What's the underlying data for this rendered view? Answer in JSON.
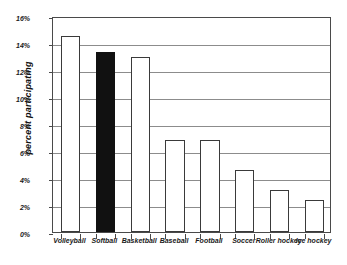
{
  "chart_data": {
    "type": "bar",
    "title": "",
    "xlabel": "",
    "ylabel": "percent participating",
    "categories": [
      "Volleyball",
      "Softball",
      "Basketball",
      "Baseball",
      "Football",
      "Soccer",
      "Roller hockey",
      "Ice hockey"
    ],
    "values": [
      14.5,
      13.3,
      13.0,
      6.8,
      6.8,
      4.6,
      3.1,
      2.4
    ],
    "ylim": [
      0,
      16
    ],
    "ytick_values": [
      0,
      2,
      4,
      6,
      8,
      10,
      12,
      14,
      16
    ],
    "ytick_labels": [
      "0%",
      "2%",
      "4%",
      "6%",
      "8%",
      "10%",
      "12%",
      "14%",
      "16%"
    ],
    "grid": true,
    "legend": "none",
    "highlighted_category": "Softball",
    "colors": {
      "bar_fill": "#ffffff",
      "bar_edge": "#3a3a3a",
      "highlight_fill": "#111111",
      "gridline": "#8c8c8c",
      "axis": "#4a4a4a",
      "background": "#ffffff",
      "text": "#1a1a1a"
    }
  }
}
